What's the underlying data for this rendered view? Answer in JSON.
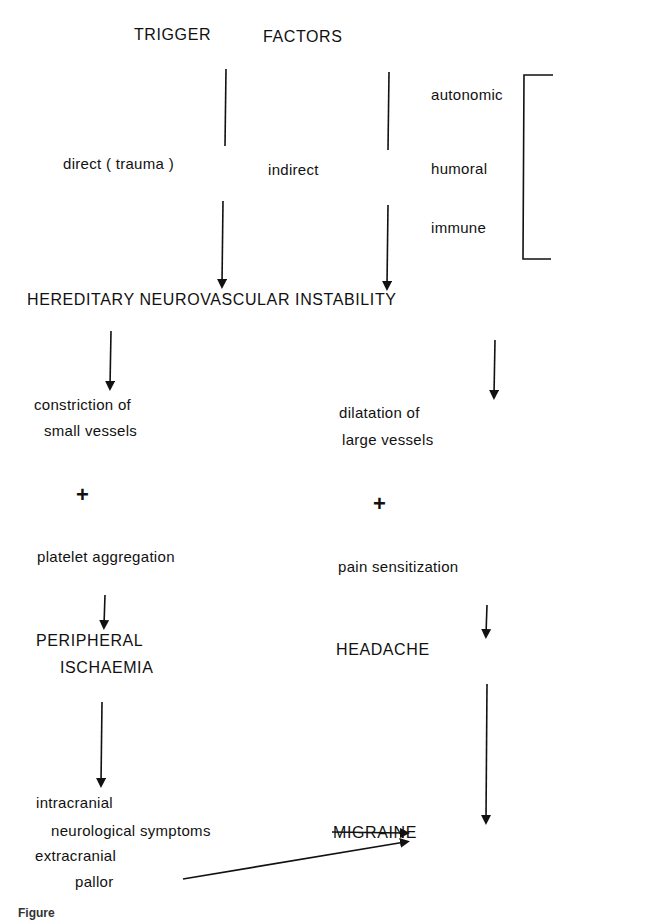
{
  "diagram": {
    "header": {
      "left": "TRIGGER",
      "right": "FACTORS"
    },
    "trigger": {
      "direct": "direct ( trauma )",
      "indirect": "indirect"
    },
    "bracket_items": [
      "autonomic",
      "humoral",
      "immune"
    ],
    "central": "HEREDITARY NEUROVASCULAR INSTABILITY",
    "left_branch": {
      "step1_line1": "constriction of",
      "step1_line2": "small vessels",
      "plus": "+",
      "step2": "platelet aggregation",
      "result_line1": "PERIPHERAL",
      "result_line2": "ISCHAEMIA",
      "symptoms": {
        "intracranial": "intracranial",
        "neuro": "neurological symptoms",
        "extracranial": "extracranial",
        "pallor": "pallor"
      }
    },
    "right_branch": {
      "step1_line1": "dilatation of",
      "step1_line2": "large vessels",
      "plus": "+",
      "step2": "pain sensitization",
      "result": "HEADACHE"
    },
    "outcome": "MIGRAINE",
    "caption_fragment": "Figure"
  }
}
